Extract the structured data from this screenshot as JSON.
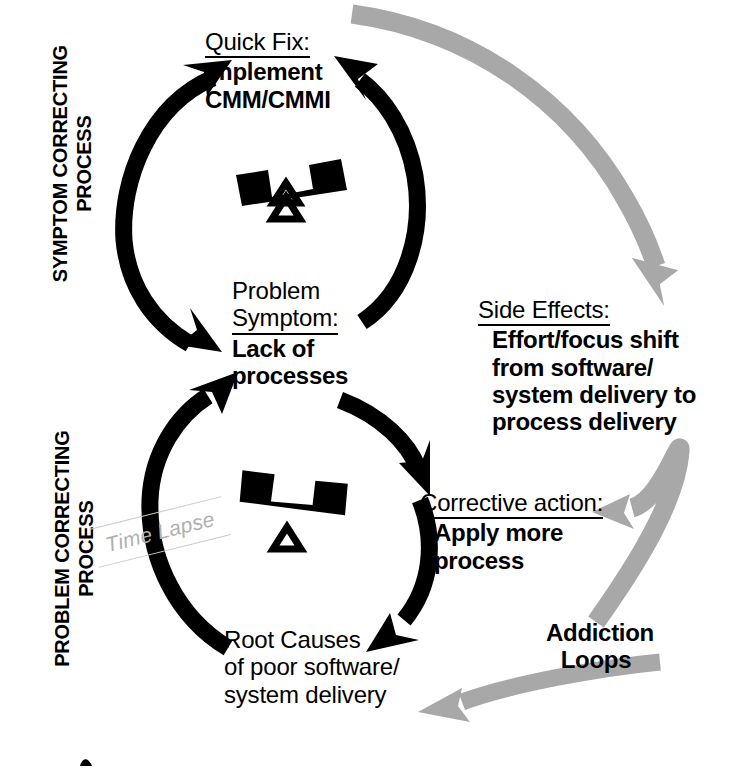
{
  "diagram": {
    "title": "Addiction Loops",
    "colors": {
      "ink": "#000000",
      "gray_arrow": "#a8a8a8",
      "time_lapse_gray": "#b0b0b0",
      "background": "#ffffff"
    },
    "side_labels": {
      "upper": {
        "line1": "SYMPTOM CORRECTING",
        "line2": "PROCESS"
      },
      "lower": {
        "line1": "PROBLEM CORRECTING",
        "line2": "PROCESS"
      }
    },
    "nodes": {
      "quick_fix": {
        "header": "Quick Fix:",
        "line1": "Implement",
        "line2": "CMM/CMMI"
      },
      "problem_symptom": {
        "header_line1": "Problem",
        "header_line2": "Symptom:",
        "line1": "Lack of",
        "line2": "processes"
      },
      "root_causes": {
        "line1": "Root Causes",
        "line2": "of poor software/",
        "line3": "system delivery"
      },
      "corrective_action": {
        "header": "Corrective action:",
        "line1": "Apply more",
        "line2": "process"
      },
      "side_effects": {
        "header": "Side Effects:",
        "line1": "Effort/focus shift",
        "line2": "from software/",
        "line3": "system delivery to",
        "line4": "process delivery"
      },
      "addiction_loops": {
        "line1": "Addiction",
        "line2": "Loops"
      }
    },
    "delay_marker": {
      "label": "Time Lapse"
    },
    "icons": {
      "balance_top": "seesaw-balance-icon",
      "balance_bottom": "seesaw-balance-icon"
    }
  }
}
